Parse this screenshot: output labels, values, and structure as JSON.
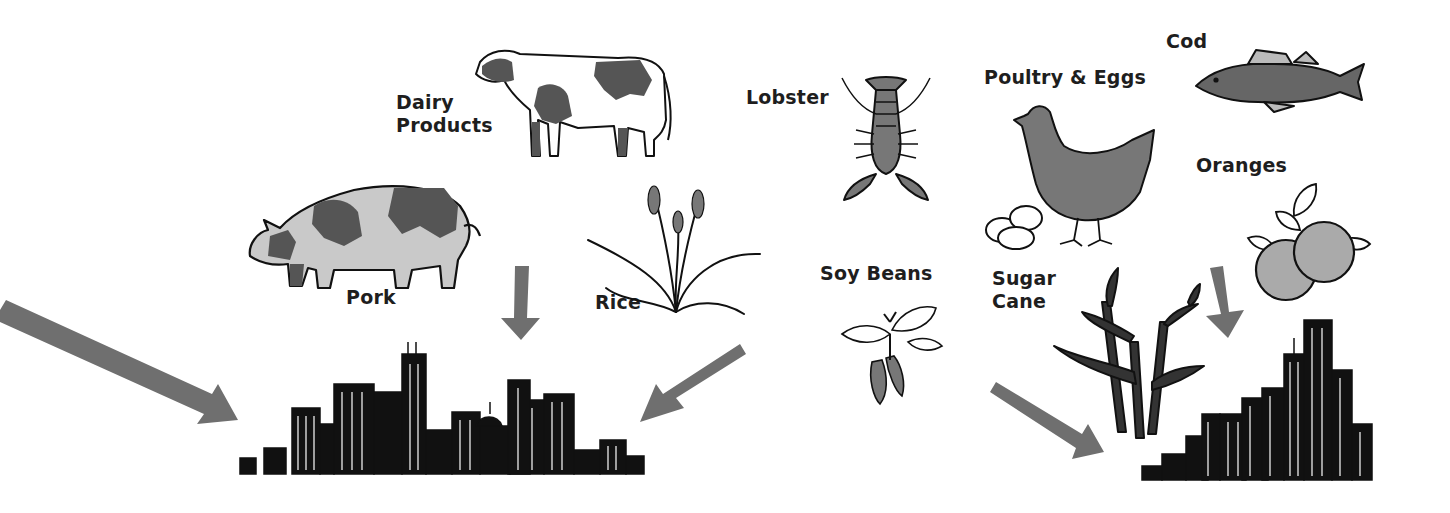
{
  "diagram": {
    "type": "food-flow-illustration",
    "colors": {
      "arrow": "#6f6f6f",
      "ink": "#111111",
      "fill_gray": "#8a8a8a",
      "fill_light": "#c9c9c9",
      "background": "#ffffff"
    },
    "labels": {
      "dairy_line1": "Dairy",
      "dairy_line2": "Products",
      "pork": "Pork",
      "rice": "Rice",
      "lobster": "Lobster",
      "soy_beans": "Soy Beans",
      "poultry_eggs": "Poultry & Eggs",
      "cod": "Cod",
      "oranges": "Oranges",
      "sugar_line1": "Sugar",
      "sugar_line2": "Cane"
    },
    "nodes": [
      {
        "id": "dairy",
        "label": "Dairy Products",
        "icon": "cow"
      },
      {
        "id": "pork",
        "label": "Pork",
        "icon": "pig"
      },
      {
        "id": "rice",
        "label": "Rice",
        "icon": "rice-plant"
      },
      {
        "id": "lobster",
        "label": "Lobster",
        "icon": "lobster"
      },
      {
        "id": "soy",
        "label": "Soy Beans",
        "icon": "soy-plant"
      },
      {
        "id": "poultry",
        "label": "Poultry & Eggs",
        "icon": "hen-with-eggs"
      },
      {
        "id": "cod",
        "label": "Cod",
        "icon": "fish"
      },
      {
        "id": "oranges",
        "label": "Oranges",
        "icon": "oranges"
      },
      {
        "id": "sugar",
        "label": "Sugar Cane",
        "icon": "sugar-cane"
      },
      {
        "id": "city_left",
        "label": "",
        "icon": "city-skyline"
      },
      {
        "id": "city_right",
        "label": "",
        "icon": "city-skyline"
      }
    ],
    "arrows": [
      {
        "from": "offscreen-left",
        "to": "city_left"
      },
      {
        "from": "pork",
        "to": "city_left"
      },
      {
        "from": "rice",
        "to": "city_left"
      },
      {
        "from": "soy",
        "to": "city_right"
      },
      {
        "from": "oranges",
        "to": "city_right"
      }
    ]
  }
}
